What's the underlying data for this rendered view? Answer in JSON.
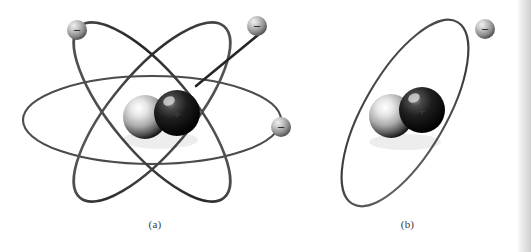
{
  "figure": {
    "background_color": "#ffffff",
    "width": 531,
    "height": 252,
    "credit": "© Fabrizio Zanon/iStockphoto.com"
  },
  "panels": [
    {
      "id": "a",
      "caption": "(a)",
      "description": "Rutherford-Bohr style atom with three intersecting elliptical electron orbits",
      "orbit_count": 3,
      "electron_count": 3,
      "nucleus": {
        "particles": [
          {
            "name": "neutron",
            "symbol": "",
            "color": "#b9b9b9",
            "highlight": "#f4f4f4"
          },
          {
            "name": "proton",
            "symbol": "+",
            "color": "#141414",
            "highlight": "#6f6f6f"
          }
        ]
      },
      "electrons": [
        {
          "label": "electron-1",
          "symbol": "−",
          "color": "#a8a8a8"
        },
        {
          "label": "electron-2",
          "symbol": "−",
          "color": "#a8a8a8"
        },
        {
          "label": "electron-3",
          "symbol": "−",
          "color": "#a8a8a8"
        }
      ],
      "orbits": [
        {
          "label": "orbit-horizontal",
          "stroke": "#4b4b4b"
        },
        {
          "label": "orbit-diagonal-left",
          "stroke": "#3a3a3a"
        },
        {
          "label": "orbit-diagonal-right",
          "stroke": "#2e2e2e"
        }
      ]
    },
    {
      "id": "b",
      "caption": "(b)",
      "description": "Simplified atom with a single tilted elliptical electron orbit",
      "orbit_count": 1,
      "electron_count": 1,
      "nucleus": {
        "particles": [
          {
            "name": "neutron",
            "symbol": "",
            "color": "#b9b9b9",
            "highlight": "#f4f4f4"
          },
          {
            "name": "proton",
            "symbol": "+",
            "color": "#141414",
            "highlight": "#6f6f6f"
          }
        ]
      },
      "electrons": [
        {
          "label": "electron-1",
          "symbol": "−",
          "color": "#a8a8a8"
        }
      ],
      "orbits": [
        {
          "label": "orbit-tilted",
          "stroke": "#4b4b4b"
        }
      ]
    }
  ],
  "colors": {
    "orbit_dark": "#2e2e2e",
    "orbit_mid": "#4b4b4b",
    "electron_gray": "#a8a8a8",
    "nucleus_light": "#cfcfcf",
    "nucleus_dark": "#101010",
    "caption_text": "#3a3a3a",
    "credit_text": "#8d8d8d"
  }
}
